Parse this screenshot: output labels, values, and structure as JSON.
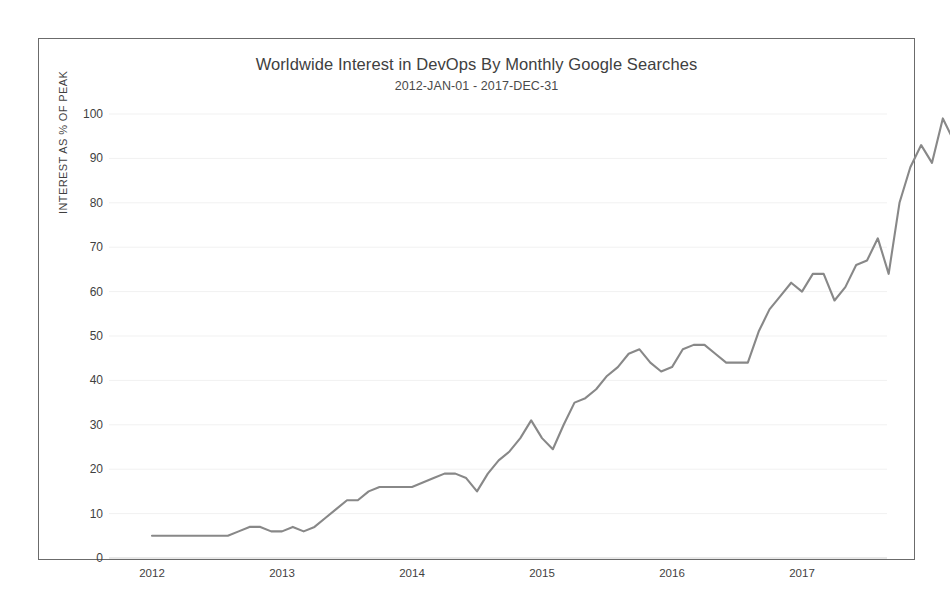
{
  "chart_data": {
    "type": "line",
    "title": "Worldwide Interest in DevOps By Monthly Google Searches",
    "subtitle": "2012-JAN-01 - 2017-DEC-31",
    "xlabel": "",
    "ylabel": "INTEREST AS % OF PEAK",
    "ylim": [
      0,
      100
    ],
    "xlim": [
      "2012",
      "2018"
    ],
    "y_ticks": [
      0,
      10,
      20,
      30,
      40,
      50,
      60,
      70,
      80,
      90,
      100
    ],
    "y_tick_labels": [
      "0",
      "10",
      "20",
      "30",
      "40",
      "50",
      "60",
      "70",
      "80",
      "90",
      "100"
    ],
    "x_ticks": [
      "2012",
      "2013",
      "2014",
      "2015",
      "2016",
      "2017"
    ],
    "x_tick_labels": [
      "2012",
      "2013",
      "2014",
      "2015",
      "2016",
      "2017"
    ],
    "grid": true,
    "grid_axis": "y",
    "legend": false,
    "line_color": "#888888",
    "frame_color": "#6b6b6b",
    "background": "#ffffff",
    "x": [
      "2012-01",
      "2012-02",
      "2012-03",
      "2012-04",
      "2012-05",
      "2012-06",
      "2012-07",
      "2012-08",
      "2012-09",
      "2012-10",
      "2012-11",
      "2012-12",
      "2013-01",
      "2013-02",
      "2013-03",
      "2013-04",
      "2013-05",
      "2013-06",
      "2013-07",
      "2013-08",
      "2013-09",
      "2013-10",
      "2013-11",
      "2013-12",
      "2014-01",
      "2014-02",
      "2014-03",
      "2014-04",
      "2014-05",
      "2014-06",
      "2014-07",
      "2014-08",
      "2014-09",
      "2014-10",
      "2014-11",
      "2014-12",
      "2015-01",
      "2015-02",
      "2015-03",
      "2015-04",
      "2015-05",
      "2015-06",
      "2015-07",
      "2015-08",
      "2015-09",
      "2015-10",
      "2015-11",
      "2015-12",
      "2016-01",
      "2016-02",
      "2016-03",
      "2016-04",
      "2016-05",
      "2016-06",
      "2016-07",
      "2016-08",
      "2016-09",
      "2016-10",
      "2016-11",
      "2016-12",
      "2017-01",
      "2017-02",
      "2017-03",
      "2017-04",
      "2017-05",
      "2017-06",
      "2017-07",
      "2017-08",
      "2017-09",
      "2017-10",
      "2017-11",
      "2017-12"
    ],
    "values": [
      5,
      5,
      5,
      5,
      5,
      5,
      5,
      5,
      6,
      7,
      7,
      6,
      6,
      7,
      6,
      7,
      9,
      11,
      13,
      13,
      15,
      16,
      16,
      16,
      16,
      17,
      18,
      19,
      19,
      18,
      15,
      19,
      22,
      24,
      27,
      31,
      27,
      24.5,
      30,
      35,
      36,
      38,
      41,
      43,
      46,
      47,
      44,
      42,
      43,
      47,
      48,
      48,
      46,
      44,
      44,
      44,
      51,
      56,
      59,
      62,
      60,
      64,
      64,
      58,
      61,
      66,
      67,
      72,
      64,
      80,
      88,
      93
    ],
    "values_extended": [
      {
        "label": "2017-08 peak region",
        "value": 93
      },
      {
        "label": "2017-09",
        "value": 89
      },
      {
        "label": "2017-10",
        "value": 99
      },
      {
        "label": "2017-11",
        "value": 94
      },
      {
        "label": "2017-12",
        "value": 83
      }
    ],
    "peak_value": 100,
    "final_value": 83,
    "annotations": []
  }
}
